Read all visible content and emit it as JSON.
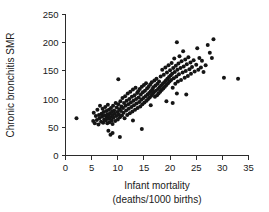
{
  "chart_data": {
    "type": "scatter",
    "title": "",
    "xlabel": "Infant mortality",
    "xlabel_line2": "(deaths/1000 births)",
    "ylabel": "Chronic bronchitis SMR",
    "xlim": [
      0,
      35
    ],
    "ylim": [
      0,
      250
    ],
    "xticks": [
      0,
      5,
      10,
      15,
      20,
      25,
      30,
      35
    ],
    "yticks": [
      0,
      50,
      100,
      150,
      200,
      250
    ],
    "xtick_labels": [
      "0",
      "5",
      "10",
      "15",
      "20",
      "25",
      "30",
      "35"
    ],
    "ytick_labels": [
      "0",
      "50",
      "100",
      "150",
      "200",
      "250"
    ],
    "grid": false,
    "legend": null,
    "marker": "filled-circle",
    "marker_color": "#151515",
    "marker_size": 2.0,
    "n_points": 198,
    "points": [
      [
        2.1,
        66
      ],
      [
        5.3,
        61
      ],
      [
        5.4,
        76
      ],
      [
        5.6,
        57
      ],
      [
        5.8,
        70
      ],
      [
        6.0,
        63
      ],
      [
        6.1,
        81
      ],
      [
        6.3,
        55
      ],
      [
        6.4,
        72
      ],
      [
        6.5,
        66
      ],
      [
        6.6,
        88
      ],
      [
        6.8,
        60
      ],
      [
        6.9,
        74
      ],
      [
        7.0,
        69
      ],
      [
        7.1,
        83
      ],
      [
        7.2,
        58
      ],
      [
        7.3,
        77
      ],
      [
        7.4,
        64
      ],
      [
        7.5,
        71
      ],
      [
        7.6,
        86
      ],
      [
        7.7,
        62
      ],
      [
        7.8,
        79
      ],
      [
        7.9,
        67
      ],
      [
        8.0,
        73
      ],
      [
        8.0,
        57
      ],
      [
        8.1,
        90
      ],
      [
        8.2,
        65
      ],
      [
        8.3,
        81
      ],
      [
        8.3,
        70
      ],
      [
        8.4,
        59
      ],
      [
        8.5,
        75
      ],
      [
        8.6,
        68
      ],
      [
        8.7,
        84
      ],
      [
        8.8,
        62
      ],
      [
        8.9,
        78
      ],
      [
        9.0,
        72
      ],
      [
        9.0,
        56
      ],
      [
        9.1,
        88
      ],
      [
        9.2,
        67
      ],
      [
        9.3,
        80
      ],
      [
        9.4,
        74
      ],
      [
        9.5,
        61
      ],
      [
        9.6,
        93
      ],
      [
        9.7,
        70
      ],
      [
        9.8,
        85
      ],
      [
        9.9,
        77
      ],
      [
        10.0,
        64
      ],
      [
        10.1,
        91
      ],
      [
        10.2,
        73
      ],
      [
        10.3,
        82
      ],
      [
        10.4,
        68
      ],
      [
        10.5,
        96
      ],
      [
        10.6,
        79
      ],
      [
        10.7,
        87
      ],
      [
        10.8,
        71
      ],
      [
        10.9,
        102
      ],
      [
        11.0,
        84
      ],
      [
        11.1,
        76
      ],
      [
        11.2,
        93
      ],
      [
        11.3,
        66
      ],
      [
        11.4,
        105
      ],
      [
        11.5,
        88
      ],
      [
        11.6,
        80
      ],
      [
        11.7,
        97
      ],
      [
        11.8,
        72
      ],
      [
        11.9,
        110
      ],
      [
        12.0,
        91
      ],
      [
        12.1,
        83
      ],
      [
        12.2,
        100
      ],
      [
        12.3,
        75
      ],
      [
        12.4,
        113
      ],
      [
        12.5,
        94
      ],
      [
        12.6,
        86
      ],
      [
        12.7,
        104
      ],
      [
        12.8,
        78
      ],
      [
        12.9,
        117
      ],
      [
        13.0,
        97
      ],
      [
        13.1,
        89
      ],
      [
        13.2,
        107
      ],
      [
        13.3,
        81
      ],
      [
        13.4,
        120
      ],
      [
        13.5,
        100
      ],
      [
        13.6,
        92
      ],
      [
        13.7,
        111
      ],
      [
        13.8,
        84
      ],
      [
        13.9,
        114
      ],
      [
        14.0,
        103
      ],
      [
        14.1,
        95
      ],
      [
        14.2,
        118
      ],
      [
        14.3,
        87
      ],
      [
        14.4,
        108
      ],
      [
        14.5,
        99
      ],
      [
        14.6,
        122
      ],
      [
        14.7,
        91
      ],
      [
        14.8,
        112
      ],
      [
        14.9,
        102
      ],
      [
        15.0,
        125
      ],
      [
        15.1,
        94
      ],
      [
        15.2,
        115
      ],
      [
        15.3,
        105
      ],
      [
        15.4,
        128
      ],
      [
        15.5,
        97
      ],
      [
        15.6,
        119
      ],
      [
        15.7,
        108
      ],
      [
        15.8,
        100
      ],
      [
        15.9,
        122
      ],
      [
        16.0,
        111
      ],
      [
        16.1,
        103
      ],
      [
        16.2,
        126
      ],
      [
        16.3,
        114
      ],
      [
        16.4,
        106
      ],
      [
        16.5,
        130
      ],
      [
        16.6,
        117
      ],
      [
        16.7,
        109
      ],
      [
        16.8,
        121
      ],
      [
        16.9,
        112
      ],
      [
        17.0,
        133
      ],
      [
        17.1,
        104
      ],
      [
        17.2,
        124
      ],
      [
        17.3,
        115
      ],
      [
        17.4,
        136
      ],
      [
        17.5,
        107
      ],
      [
        17.6,
        127
      ],
      [
        17.7,
        118
      ],
      [
        17.8,
        110
      ],
      [
        17.9,
        131
      ],
      [
        18.0,
        121
      ],
      [
        18.1,
        113
      ],
      [
        18.2,
        140
      ],
      [
        18.3,
        124
      ],
      [
        18.4,
        116
      ],
      [
        18.5,
        152
      ],
      [
        18.6,
        127
      ],
      [
        18.7,
        119
      ],
      [
        18.8,
        143
      ],
      [
        18.9,
        130
      ],
      [
        19.0,
        122
      ],
      [
        19.1,
        156
      ],
      [
        19.2,
        133
      ],
      [
        19.3,
        125
      ],
      [
        19.4,
        147
      ],
      [
        19.5,
        136
      ],
      [
        19.6,
        128
      ],
      [
        19.7,
        160
      ],
      [
        19.8,
        139
      ],
      [
        19.9,
        131
      ],
      [
        20.0,
        151
      ],
      [
        20.1,
        142
      ],
      [
        20.2,
        134
      ],
      [
        20.3,
        164
      ],
      [
        20.4,
        145
      ],
      [
        20.5,
        120
      ],
      [
        20.6,
        155
      ],
      [
        20.7,
        137
      ],
      [
        20.8,
        172
      ],
      [
        20.9,
        148
      ],
      [
        21.0,
        127
      ],
      [
        21.1,
        159
      ],
      [
        21.2,
        140
      ],
      [
        21.3,
        201
      ],
      [
        21.4,
        152
      ],
      [
        21.5,
        131
      ],
      [
        21.6,
        163
      ],
      [
        21.7,
        144
      ],
      [
        21.8,
        176
      ],
      [
        22.0,
        155
      ],
      [
        22.1,
        134
      ],
      [
        22.2,
        167
      ],
      [
        22.4,
        147
      ],
      [
        22.5,
        185
      ],
      [
        22.6,
        158
      ],
      [
        22.8,
        138
      ],
      [
        22.9,
        170
      ],
      [
        23.0,
        150
      ],
      [
        23.2,
        162
      ],
      [
        23.4,
        141
      ],
      [
        23.5,
        174
      ],
      [
        23.7,
        153
      ],
      [
        23.9,
        165
      ],
      [
        24.0,
        145
      ],
      [
        24.2,
        157
      ],
      [
        24.5,
        169
      ],
      [
        24.7,
        149
      ],
      [
        25.0,
        161
      ],
      [
        25.2,
        190
      ],
      [
        25.4,
        152
      ],
      [
        25.6,
        173
      ],
      [
        25.9,
        156
      ],
      [
        26.1,
        168
      ],
      [
        26.4,
        148
      ],
      [
        26.8,
        160
      ],
      [
        27.2,
        196
      ],
      [
        27.6,
        182
      ],
      [
        28.0,
        173
      ],
      [
        28.3,
        206
      ],
      [
        20.5,
        93
      ],
      [
        21.3,
        110
      ],
      [
        23.1,
        108
      ],
      [
        19.3,
        96
      ],
      [
        8.2,
        44
      ],
      [
        8.6,
        37
      ],
      [
        9.0,
        40
      ],
      [
        10.4,
        33
      ],
      [
        14.6,
        47
      ],
      [
        10.1,
        135
      ],
      [
        12.9,
        62
      ],
      [
        16.3,
        89
      ],
      [
        30.3,
        138
      ],
      [
        33.0,
        136
      ]
    ]
  },
  "axes": {
    "y_axis_name": "y-axis",
    "x_axis_name": "x-axis"
  }
}
